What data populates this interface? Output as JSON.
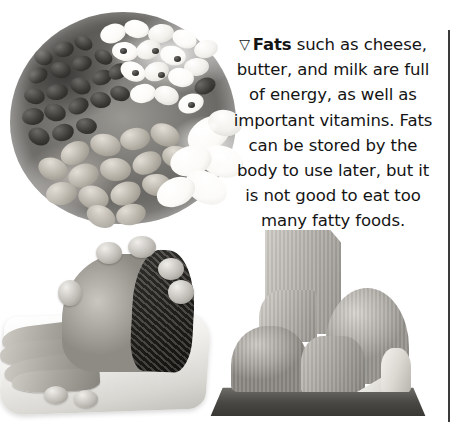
{
  "page": {
    "background_color": "#ffffff",
    "width": 459,
    "height": 422
  },
  "caption": {
    "marker_icon": "triangle-down-outline-icon",
    "marker_glyph": "▽",
    "term": "Fats",
    "text": " such as cheese, butter, and milk are full of energy, as well as important vitamins. Fats can be stored by the body to use later, but it is not good to eat too many fatty foods.",
    "full_text": "▽ Fats such as cheese, butter, and milk are full of energy, as well as important vitamins. Fats can be stored by the body to use later, but it is not good to eat too many fatty foods.",
    "lines": [
      "▽ Fats such as cheese,",
      "butter, and milk are full",
      "of energy, as well as",
      "important vitamins.",
      "Fats can be stored by",
      "the body to use later,",
      "but it is not good to eat",
      "too many fatty foods."
    ],
    "alignment": "center",
    "text_color": "#141414"
  },
  "images": [
    {
      "name": "beans-photo",
      "subject": "bowl of assorted dried beans and legumes",
      "style": "black-and-white photograph"
    },
    {
      "name": "ham-photo",
      "subject": "sliced roast ham on a serving platter",
      "style": "black-and-white photograph"
    },
    {
      "name": "cheese-photo",
      "subject": "assortment of cheese wheels, blocks and wedges on a board",
      "style": "black-and-white photograph"
    }
  ],
  "divider": {
    "name": "column-rule",
    "color": "#3a3a3a",
    "orientation": "vertical"
  }
}
